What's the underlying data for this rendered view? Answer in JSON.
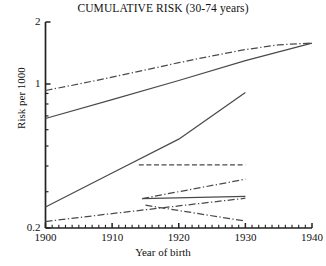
{
  "chart_data": {
    "type": "line",
    "title": "CUMULATIVE RISK (30-74 years)",
    "xlabel": "Year of birth",
    "ylabel": "Risk per 1000",
    "xlim": [
      1900,
      1940
    ],
    "ylim": [
      0.2,
      2
    ],
    "yscale": "log",
    "grid": false,
    "legend": "none",
    "xticks": [
      1900,
      1910,
      1920,
      1930,
      1940
    ],
    "xtick_labels": [
      "1900",
      "1910",
      "1920",
      "1930",
      "1940"
    ],
    "xminor_tick_step": 1,
    "yticks": [
      0.2,
      1,
      2
    ],
    "ytick_labels": [
      "0.2",
      "1",
      "2"
    ],
    "yminor_ticks": [
      0.3,
      0.4,
      0.5,
      0.6,
      0.7,
      0.8,
      0.9
    ],
    "series": [
      {
        "name": "upper-dashdot-long",
        "style": "dashdot",
        "x": [
          1900,
          1905,
          1910,
          1915,
          1920,
          1925,
          1930,
          1935,
          1940
        ],
        "y": [
          0.93,
          1.0,
          1.08,
          1.17,
          1.27,
          1.37,
          1.47,
          1.55,
          1.58
        ]
      },
      {
        "name": "upper-solid-long",
        "style": "solid",
        "x": [
          1900,
          1910,
          1920,
          1930,
          1940
        ],
        "y": [
          0.68,
          0.84,
          1.04,
          1.3,
          1.58
        ]
      },
      {
        "name": "steep-solid-rising",
        "style": "solid",
        "x": [
          1900,
          1910,
          1920,
          1930
        ],
        "y": [
          0.253,
          0.37,
          0.54,
          0.91
        ]
      },
      {
        "name": "lower-dashdot-long-rising",
        "style": "dashdot",
        "x": [
          1900,
          1910,
          1920,
          1930
        ],
        "y": [
          0.215,
          0.235,
          0.256,
          0.279
        ]
      },
      {
        "name": "flat-dashed-upper-short",
        "style": "dashed",
        "x": [
          1914,
          1930
        ],
        "y": [
          0.405,
          0.405
        ]
      },
      {
        "name": "short-dashdot-rising",
        "style": "dashdot",
        "x": [
          1914.5,
          1930
        ],
        "y": [
          0.278,
          0.345
        ]
      },
      {
        "name": "short-solid-flat",
        "style": "solid",
        "x": [
          1914.5,
          1930
        ],
        "y": [
          0.278,
          0.285
        ]
      },
      {
        "name": "short-dashdot-declining",
        "style": "dashdot",
        "x": [
          1915,
          1930
        ],
        "y": [
          0.258,
          0.216
        ]
      }
    ]
  }
}
